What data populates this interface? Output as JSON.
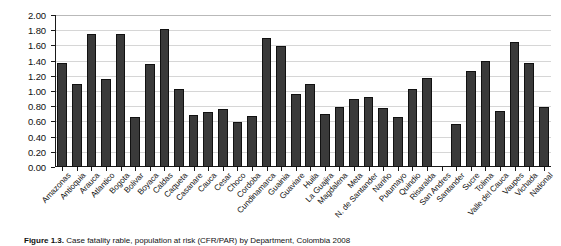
{
  "chart_data": {
    "type": "bar",
    "title": "",
    "subtitle": "",
    "xlabel": "",
    "ylabel": "",
    "ylim": [
      0.0,
      2.0
    ],
    "ytick_step": 0.2,
    "ytick_labels": [
      "2.00",
      "1.80",
      "1.60",
      "1.40",
      "1.20",
      "1.00",
      "0.80",
      "0.60",
      "0.40",
      "0.20",
      "0.00"
    ],
    "ytick_values": [
      2.0,
      1.8,
      1.6,
      1.4,
      1.2,
      1.0,
      0.8,
      0.6,
      0.4,
      0.2,
      0.0
    ],
    "grid": true,
    "legend": "none",
    "bar_color": "#3a3a3a",
    "bar_edge_color": "#111111",
    "categories": [
      "Amazonas",
      "Antioquia",
      "Arauca",
      "Atlantico",
      "Bogota",
      "Bolivar",
      "Boyaca",
      "Caldas",
      "Caqueta",
      "Casanare",
      "Cauca",
      "Cesar",
      "Choco",
      "Cordoba",
      "Cundinamarca",
      "Guainia",
      "Guaviare",
      "Huila",
      "La Guajira",
      "Magdalena",
      "Meta",
      "N. de Santander",
      "Nariño",
      "Putumayo",
      "Quindio",
      "Risaralda",
      "San Andres",
      "Santander",
      "Sucre",
      "Tolima",
      "Valle del Cauca",
      "Vaupes",
      "Vichada",
      "National"
    ],
    "values": [
      1.37,
      1.09,
      1.75,
      1.16,
      1.75,
      0.66,
      1.35,
      1.81,
      1.02,
      0.69,
      0.72,
      0.76,
      0.59,
      0.67,
      1.7,
      1.59,
      0.96,
      1.09,
      0.7,
      0.79,
      0.89,
      0.92,
      0.78,
      0.66,
      1.03,
      1.17,
      0.0,
      0.57,
      1.26,
      1.4,
      0.74,
      1.65,
      1.37,
      0.79
    ]
  },
  "caption": {
    "label": "Figure 1.3.",
    "text": "Case fatality rable, population at risk (CFR/PAR) by Department, Colombia 2008"
  }
}
